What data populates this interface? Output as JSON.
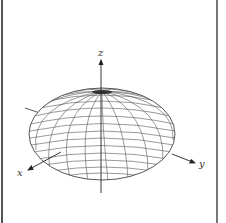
{
  "figure": {
    "axes": {
      "x_label": "x",
      "y_label": "y",
      "z_label": "z"
    },
    "colors": {
      "mesh": "#555555",
      "axis": "#222222",
      "border": "#555555",
      "background": "#ffffff"
    }
  }
}
